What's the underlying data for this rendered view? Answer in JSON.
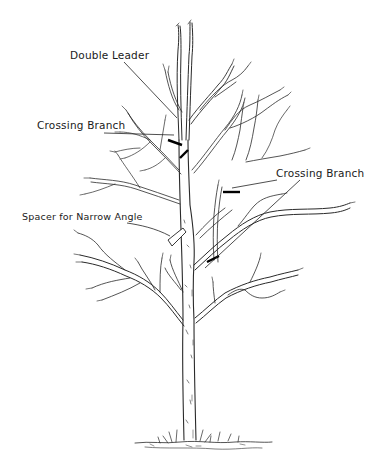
{
  "illustration": {
    "subject": "Young deciduous tree in dormant season, pen-and-ink drawing showing pruning problems",
    "background_color": "#ffffff",
    "ink_color": "#1a1a1a"
  },
  "labels": [
    {
      "id": "double-leader",
      "text": "Double Leader",
      "x": 70,
      "y": 49
    },
    {
      "id": "crossing-branch-left",
      "text": "Crossing Branch",
      "x": 37,
      "y": 119
    },
    {
      "id": "crossing-branch-right",
      "text": "Crossing Branch",
      "x": 276,
      "y": 167
    },
    {
      "id": "spacer-narrow-angle",
      "text": "Spacer for Narrow Angle",
      "x": 22,
      "y": 210
    }
  ]
}
